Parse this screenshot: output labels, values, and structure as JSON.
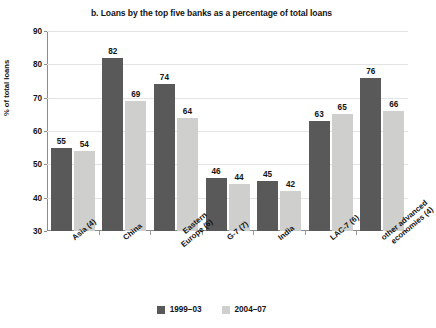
{
  "chart_data": {
    "type": "bar",
    "title": "b. Loans by the top five banks as a percentage of total loans",
    "xlabel": "",
    "ylabel": "% of total loans",
    "ylim": [
      30,
      90
    ],
    "ytick_step": 10,
    "yticks": [
      30,
      40,
      50,
      60,
      70,
      80,
      90
    ],
    "grid": true,
    "legend_position": "bottom",
    "categories": [
      "Asia (4)",
      "China",
      "Eastern Europe (6)",
      "G-7 (7)",
      "India",
      "LAC-7 (6)",
      "other advanced economies (4)"
    ],
    "category_lines": [
      [
        "Asia (4)"
      ],
      [
        "China"
      ],
      [
        "Eastern",
        "Europe (6)"
      ],
      [
        "G-7 (7)"
      ],
      [
        "India"
      ],
      [
        "LAC-7 (6)"
      ],
      [
        "other advanced",
        "economies (4)"
      ]
    ],
    "series": [
      {
        "name": "1999–03",
        "color": "#595959",
        "values": [
          55,
          82,
          74,
          46,
          45,
          63,
          76
        ]
      },
      {
        "name": "2004–07",
        "color": "#cfd0ce",
        "values": [
          54,
          69,
          64,
          44,
          42,
          65,
          66
        ]
      }
    ]
  },
  "colors": {
    "series_1999_03": "#595959",
    "series_2004_07": "#cfd0ce",
    "axis": "#8c8c8c",
    "gridline": "#e4e4e4",
    "text": "#141414",
    "background": "#ffffff"
  }
}
